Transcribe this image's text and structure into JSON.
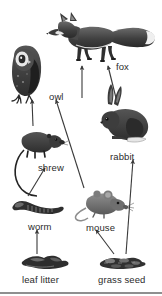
{
  "figure": {
    "background_color": "#ffffff",
    "ink_color": "#2b2b2b",
    "arrow_color": "#3a3a3a",
    "width": 162,
    "height": 296
  },
  "nodes": [
    {
      "id": "fox",
      "label": "fox",
      "label_x": 116,
      "label_y": 62,
      "art_x": 60,
      "art_y": 14,
      "art_w": 98,
      "art_h": 48,
      "kind": "animal"
    },
    {
      "id": "owl",
      "label": "owl",
      "label_x": 49,
      "label_y": 92,
      "art_x": 6,
      "art_y": 48,
      "art_w": 44,
      "art_h": 58,
      "kind": "animal"
    },
    {
      "id": "rabbit",
      "label": "rabbit",
      "label_x": 110,
      "label_y": 152,
      "art_x": 95,
      "art_y": 100,
      "art_w": 56,
      "art_h": 50,
      "kind": "animal"
    },
    {
      "id": "shrew",
      "label": "shrew",
      "label_x": 38,
      "label_y": 163,
      "art_x": 20,
      "art_y": 128,
      "art_w": 44,
      "art_h": 32,
      "kind": "animal"
    },
    {
      "id": "mouse",
      "label": "mouse",
      "label_x": 86,
      "label_y": 223,
      "art_x": 82,
      "art_y": 190,
      "art_w": 46,
      "art_h": 30,
      "kind": "animal"
    },
    {
      "id": "worm",
      "label": "worm",
      "label_x": 28,
      "label_y": 222,
      "art_x": 11,
      "art_y": 198,
      "art_w": 52,
      "art_h": 20,
      "kind": "animal"
    },
    {
      "id": "leaf-litter",
      "label": "leaf litter",
      "label_x": 22,
      "label_y": 275,
      "art_x": 21,
      "art_y": 256,
      "art_w": 48,
      "art_h": 14,
      "kind": "resource"
    },
    {
      "id": "grass-seed",
      "label": "grass seed",
      "label_x": 98,
      "label_y": 275,
      "art_x": 100,
      "art_y": 256,
      "art_w": 48,
      "art_h": 14,
      "kind": "resource"
    }
  ],
  "arrows": [
    {
      "id": "shrew-to-owl",
      "from": "shrew",
      "to": "owl",
      "x1": 33,
      "y1": 126,
      "x2": 32,
      "y2": 100
    },
    {
      "id": "mouse-to-owl",
      "from": "mouse",
      "to": "owl",
      "x1": 84,
      "y1": 188,
      "x2": 56,
      "y2": 100
    },
    {
      "id": "worm-to-shrew",
      "from": "worm",
      "to": "shrew",
      "x1": 28,
      "y1": 196,
      "x2": 45,
      "y2": 168
    },
    {
      "id": "leaf-litter-to-worm",
      "from": "leaf litter",
      "to": "worm",
      "x1": 37,
      "y1": 254,
      "x2": 37,
      "y2": 230
    },
    {
      "id": "grass-seed-to-mouse",
      "from": "grass seed",
      "to": "mouse",
      "x1": 114,
      "y1": 254,
      "x2": 96,
      "y2": 230
    },
    {
      "id": "grass-seed-to-rabbit",
      "from": "grass seed",
      "to": "rabbit",
      "x1": 126,
      "y1": 254,
      "x2": 133,
      "y2": 160
    },
    {
      "id": "owl-to-fox",
      "from": "owl",
      "to": "fox",
      "x1": 82,
      "y1": 98,
      "x2": 82,
      "y2": 66
    },
    {
      "id": "rabbit-to-fox",
      "from": "rabbit",
      "to": "fox",
      "x1": 116,
      "y1": 98,
      "x2": 108,
      "y2": 66
    }
  ],
  "baseline": {
    "y": 292,
    "color": "#8f8f8f"
  }
}
